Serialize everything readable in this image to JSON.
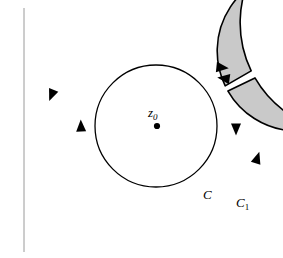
{
  "figure": {
    "name": "annulus-contour-diagram",
    "background_color": "#ffffff",
    "annulus_fill_color": "#c9c9c9",
    "stroke_color": "#000000",
    "interior_fill_color": "#ffffff",
    "margin_rule": {
      "name": "left-margin-rule",
      "color": "#9a9a9a",
      "x": 24,
      "y_top": 8,
      "y_bottom": 252
    },
    "geometry": {
      "center_x": 156,
      "center_y": 126,
      "outer_radius": 110,
      "middle_radius": 80,
      "inner_radius": 61,
      "cut_angle_degrees": -28,
      "cut_half_width_degrees": 2.1
    },
    "labels": {
      "center_point": "z",
      "center_point_subscript": "0",
      "inner_contour": "C",
      "outer_contour": "C",
      "outer_contour_subscript": "1"
    },
    "arrowheads": [
      {
        "name": "arrowhead-outer-upper-left",
        "x": 52,
        "y": 94,
        "rotation": 108,
        "contour": "C1"
      },
      {
        "name": "arrowhead-middle-left",
        "x": 81,
        "y": 127,
        "rotation": 270,
        "contour": "C"
      },
      {
        "name": "arrowhead-middle-right",
        "x": 236,
        "y": 128,
        "rotation": 90,
        "contour": "C"
      },
      {
        "name": "arrowhead-outer-lower-right",
        "x": 257,
        "y": 160,
        "rotation": 290,
        "contour": "C1"
      },
      {
        "name": "arrowhead-cut-upper-inward",
        "x": 221,
        "y": 68,
        "rotation": 8,
        "contour": "C1"
      },
      {
        "name": "arrowhead-cut-lower-inward",
        "x": 224,
        "y": 78,
        "rotation": 190,
        "contour": "C"
      }
    ]
  }
}
